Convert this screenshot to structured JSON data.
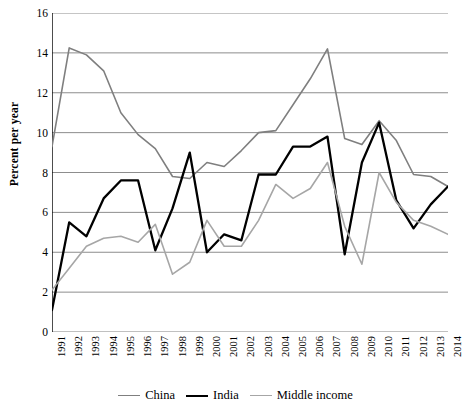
{
  "chart_data": {
    "type": "line",
    "title": "",
    "xlabel": "",
    "ylabel": "Percent per year",
    "ylim": [
      0,
      16
    ],
    "yticks": [
      0,
      2,
      4,
      6,
      8,
      10,
      12,
      14,
      16
    ],
    "grid": true,
    "legend_position": "bottom",
    "categories": [
      "1991",
      "1992",
      "1993",
      "1994",
      "1995",
      "1996",
      "1997",
      "1998",
      "1999",
      "2000",
      "2001",
      "2002",
      "2003",
      "2004",
      "2005",
      "2006",
      "2007",
      "2008",
      "2009",
      "2010",
      "2011",
      "2012",
      "2013",
      "2014"
    ],
    "series": [
      {
        "name": "China",
        "color": "#7f7f7f",
        "values": [
          9.3,
          14.25,
          13.9,
          13.1,
          11.0,
          9.9,
          9.2,
          7.8,
          7.7,
          8.5,
          8.3,
          9.1,
          10.0,
          10.1,
          11.4,
          12.7,
          14.2,
          9.7,
          9.4,
          10.6,
          9.6,
          7.9,
          7.8,
          7.3
        ]
      },
      {
        "name": "India",
        "color": "#000000",
        "values": [
          1.1,
          5.5,
          4.8,
          6.7,
          7.6,
          7.6,
          4.1,
          6.2,
          9.0,
          4.0,
          4.9,
          4.6,
          7.9,
          7.9,
          9.3,
          9.3,
          9.8,
          3.9,
          8.5,
          10.5,
          6.6,
          5.2,
          6.4,
          7.3
        ]
      },
      {
        "name": "Middle income",
        "color": "#a6a6a6",
        "values": [
          2.1,
          3.2,
          4.3,
          4.7,
          4.8,
          4.5,
          5.4,
          2.9,
          3.5,
          5.6,
          4.3,
          4.3,
          5.6,
          7.4,
          6.7,
          7.2,
          8.5,
          5.3,
          3.4,
          8.0,
          6.5,
          5.6,
          5.3,
          4.9
        ]
      }
    ]
  },
  "legend": {
    "items": [
      {
        "label": "China"
      },
      {
        "label": "India"
      },
      {
        "label": "Middle income"
      }
    ]
  }
}
